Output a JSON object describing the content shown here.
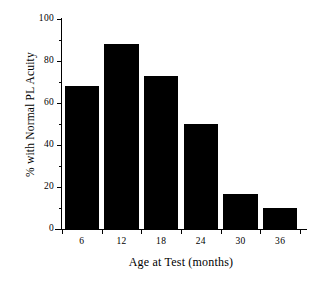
{
  "chart_data": {
    "type": "bar",
    "title": "",
    "xlabel": "Age at Test (months)",
    "ylabel": "% with Normal PL Acuity",
    "categories": [
      "6",
      "12",
      "18",
      "24",
      "30",
      "36"
    ],
    "values": [
      68,
      88,
      73,
      50,
      16.5,
      10
    ],
    "ylim": [
      0,
      100
    ],
    "ytick_labels": [
      "0",
      "20",
      "40",
      "60",
      "80",
      "100"
    ],
    "ytick_values": [
      0,
      20,
      40,
      60,
      80,
      100
    ],
    "yminor_tick_values": [
      10,
      30,
      50,
      70,
      90
    ],
    "xtick_labels": [
      "6",
      "12",
      "18",
      "24",
      "30",
      "36"
    ],
    "grid": false,
    "legend": null,
    "bar_color": "#000000",
    "axis_color": "#000000",
    "background": "#ffffff"
  }
}
